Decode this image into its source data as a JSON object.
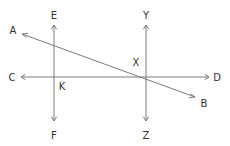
{
  "diagram": {
    "title": "",
    "line_color": "#7a7a7a",
    "label_color": "#333333",
    "lines": [
      {
        "id": "AB",
        "from": [
          22,
          34
        ],
        "to": [
          195,
          97
        ],
        "ends": [
          "A",
          "B"
        ],
        "arrows": "both"
      },
      {
        "id": "CD",
        "from": [
          21,
          77
        ],
        "to": [
          209,
          77
        ],
        "ends": [
          "C",
          "D"
        ],
        "arrows": "both"
      },
      {
        "id": "EF",
        "from": [
          54,
          25
        ],
        "to": [
          54,
          121
        ],
        "ends": [
          "E",
          "F"
        ],
        "arrows": "both"
      },
      {
        "id": "YZ",
        "from": [
          146,
          25
        ],
        "to": [
          146,
          121
        ],
        "ends": [
          "Y",
          "Z"
        ],
        "arrows": "both"
      }
    ],
    "labels": {
      "A": "A",
      "B": "B",
      "C": "C",
      "D": "D",
      "E": "E",
      "F": "F",
      "Y": "Y",
      "Z": "Z",
      "X": "X",
      "K": "K"
    },
    "intersections": [
      {
        "label": "X",
        "lines": [
          "AB",
          "CD",
          "YZ"
        ]
      },
      {
        "label": "K",
        "lines": [
          "CD",
          "EF"
        ]
      }
    ]
  }
}
